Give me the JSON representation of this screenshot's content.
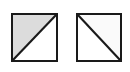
{
  "figure": {
    "title": "",
    "canvas": {
      "width": 130,
      "height": 72,
      "background": "#ffffff"
    },
    "colors": {
      "stroke": "#1a1a1a",
      "gray_fill": "#dcdcdc",
      "white_fill": "#ffffff",
      "faint_fill": "#fafafa"
    },
    "shapes": [
      {
        "name": "left-square",
        "label": "",
        "x": 11,
        "y": 13,
        "width": 47,
        "height": 49,
        "border_width": 2,
        "border_color": "#1a1a1a",
        "diagonal": "bottom-left-to-top-right",
        "diagonal_width": 2,
        "diagonal_color": "#1a1a1a",
        "upper_left_fill": "#dcdcdc",
        "lower_right_fill": "#ffffff"
      },
      {
        "name": "right-square",
        "label": "",
        "x": 76,
        "y": 13,
        "width": 46,
        "height": 49,
        "border_width": 2,
        "border_color": "#1a1a1a",
        "diagonal": "top-left-to-bottom-right",
        "diagonal_width": 2,
        "diagonal_color": "#1a1a1a",
        "upper_right_fill": "#fafafa",
        "lower_left_fill": "#ffffff"
      }
    ]
  }
}
